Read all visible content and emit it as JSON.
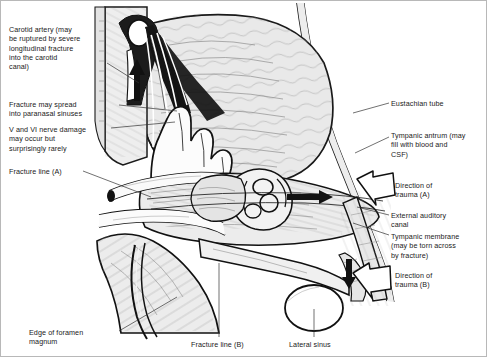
{
  "figure": {
    "type": "anatomical-line-illustration",
    "palette": {
      "ink": "#111111",
      "bone_light": "#f2f2f2",
      "brain_grey": "#e6e6e6",
      "mid_grey": "#cfcfcf",
      "dark_fill": "#1a1a1a",
      "hatch": "#8c8c8c",
      "leader": "#333333",
      "border": "#b8b8b8",
      "background": "#ffffff"
    }
  },
  "labels": {
    "carotid_artery": {
      "text": "Carotid artery (may\nbe ruptured by severe\nlongitudinal fracture\ninto the carotid\ncanal)",
      "x": 8,
      "y": 24,
      "width": 108
    },
    "fracture_paranasal": {
      "text": "Fracture may spread\ninto paranasal sinuses",
      "x": 8,
      "y": 99,
      "width": 110
    },
    "nerve_damage": {
      "text": "V and VI nerve damage\nmay occur but\nsurprisingly rarely",
      "x": 8,
      "y": 124,
      "width": 112
    },
    "fracture_line_a": {
      "text": "Fracture line (A)",
      "x": 8,
      "y": 168,
      "width": 90
    },
    "eustachian_tube": {
      "text": "Eustachian tube",
      "x": 390,
      "y": 100,
      "width": 95
    },
    "tympanic_antrum": {
      "text": "Tympanic antrum (may\nfill with blood and\nCSF)",
      "x": 390,
      "y": 131,
      "width": 95
    },
    "direction_trauma_a": {
      "text": "Direction of\ntrauma (A)",
      "x": 392,
      "y": 181,
      "width": 80
    },
    "external_auditory_canal": {
      "text": "External auditory\ncanal",
      "x": 390,
      "y": 211,
      "width": 95
    },
    "tympanic_membrane": {
      "text": "Tympanic membrane\n(may be torn across\nby fracture)",
      "x": 390,
      "y": 232,
      "width": 95
    },
    "direction_trauma_b": {
      "text": "Direction of\ntrauma (B)",
      "x": 392,
      "y": 271,
      "width": 80
    },
    "edge_foramen_magnum": {
      "text": "Edge of foramen\nmagnum",
      "x": 28,
      "y": 329,
      "width": 90
    },
    "fracture_line_b": {
      "text": "Fracture line (B)",
      "x": 192,
      "y": 340,
      "width": 80
    },
    "lateral_sinus": {
      "text": "Lateral sinus",
      "x": 288,
      "y": 340,
      "width": 70
    }
  },
  "annotations": {
    "direction_arrow_a": "hollow-arrow-pointing-upper-left",
    "direction_arrow_b": "hollow-arrow-pointing-upper-left",
    "fracture_arrow_carotid": "solid-black-arrow-pointing-up",
    "fracture_arrow_antrum": "solid-black-arrow-pointing-right",
    "fracture_arrow_sinus": "solid-black-arrow-pointing-down"
  }
}
